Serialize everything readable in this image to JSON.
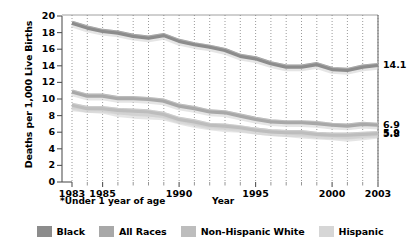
{
  "chart_data": {
    "type": "line",
    "title": "",
    "xlabel": "Year",
    "ylabel": "Deaths per 1,000 Live Births",
    "footnote": "*Under 1 year of age",
    "xlim": [
      1983,
      2003
    ],
    "ylim": [
      0,
      20
    ],
    "grid": "vertical-dotted",
    "legend_position": "bottom",
    "x_tick_labels": [
      "1983",
      "1985",
      "1990",
      "1995",
      "2000",
      "2003"
    ],
    "x_tick_values": [
      1983,
      1985,
      1990,
      1995,
      2000,
      2003
    ],
    "y_tick_labels": [
      "0",
      "2",
      "4",
      "6",
      "8",
      "10",
      "12",
      "14",
      "16",
      "18",
      "20"
    ],
    "y_tick_values": [
      0,
      2,
      4,
      6,
      8,
      10,
      12,
      14,
      16,
      18,
      20
    ],
    "x": [
      1983,
      1984,
      1985,
      1986,
      1987,
      1988,
      1989,
      1990,
      1991,
      1992,
      1993,
      1994,
      1995,
      1996,
      1997,
      1998,
      1999,
      2000,
      2001,
      2002,
      2003
    ],
    "series": [
      {
        "name": "Black",
        "color": "#8c8c8c",
        "end_label": "14.1",
        "values": [
          19.2,
          18.6,
          18.2,
          18.0,
          17.6,
          17.4,
          17.7,
          17.0,
          16.6,
          16.3,
          15.9,
          15.2,
          14.9,
          14.3,
          13.9,
          13.9,
          14.2,
          13.6,
          13.5,
          13.9,
          14.1
        ]
      },
      {
        "name": "All Races",
        "color": "#a8a8a8",
        "end_label": "6.9",
        "values": [
          10.9,
          10.4,
          10.4,
          10.1,
          10.1,
          10.0,
          9.8,
          9.2,
          8.9,
          8.5,
          8.4,
          8.0,
          7.6,
          7.3,
          7.2,
          7.2,
          7.1,
          6.9,
          6.8,
          7.0,
          6.9
        ]
      },
      {
        "name": "Non-Hispanic White",
        "color": "#bdbdbd",
        "end_label": "5.9",
        "values": [
          9.3,
          8.9,
          8.9,
          8.7,
          8.6,
          8.5,
          8.2,
          7.6,
          7.3,
          6.9,
          6.8,
          6.6,
          6.3,
          6.1,
          6.0,
          6.0,
          5.8,
          5.7,
          5.7,
          5.8,
          5.9
        ]
      },
      {
        "name": "Hispanic",
        "color": "#d6d6d6",
        "end_label": "5.8",
        "values": [
          9.1,
          8.9,
          8.8,
          8.4,
          8.2,
          8.1,
          8.0,
          7.5,
          7.1,
          6.8,
          6.6,
          6.5,
          6.3,
          6.1,
          6.0,
          5.8,
          5.7,
          5.6,
          5.4,
          5.6,
          5.8
        ]
      }
    ]
  },
  "legend": {
    "items": [
      {
        "label": "Black",
        "color": "#8c8c8c"
      },
      {
        "label": "All Races",
        "color": "#a8a8a8"
      },
      {
        "label": "Non-Hispanic White",
        "color": "#bdbdbd"
      },
      {
        "label": "Hispanic",
        "color": "#d6d6d6"
      }
    ]
  },
  "axes": {
    "y_title": "Deaths per 1,000 Live Births",
    "x_title": "Year",
    "footnote": "*Under 1 year of age"
  },
  "end_labels": [
    {
      "name": "black",
      "text": "14.1"
    },
    {
      "name": "all-races",
      "text": "6.9"
    },
    {
      "name": "non-hispanic-white",
      "text": "5.9"
    },
    {
      "name": "hispanic",
      "text": "5.8"
    }
  ]
}
